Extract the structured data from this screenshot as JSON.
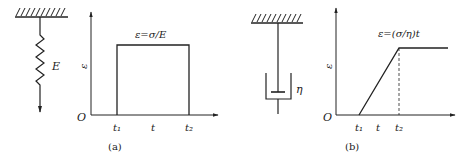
{
  "figures": [
    {
      "id": "a",
      "caption": "(a)",
      "element": {
        "type": "spring",
        "label": "E"
      },
      "plot": {
        "y_label": "ε",
        "origin": "O",
        "x_ticks": [
          "t₁",
          "t",
          "t₂"
        ],
        "curve_label": "ε=σ/E",
        "shape": "rectangular pulse: strain jumps at t₁, constant until t₂, drops to 0"
      }
    },
    {
      "id": "b",
      "caption": "(b)",
      "element": {
        "type": "dashpot",
        "label": "η"
      },
      "plot": {
        "y_label": "ε",
        "origin": "O",
        "x_ticks": [
          "t₁",
          "t",
          "t₂"
        ],
        "curve_label": "ε=(σ/η)t",
        "shape": "linear ramp from t₁ to t₂, then constant; dashed line at t₂"
      }
    }
  ],
  "colors": {
    "line": "#222222",
    "background": "#ffffff"
  }
}
